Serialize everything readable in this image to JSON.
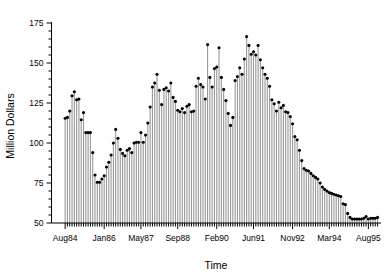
{
  "chart_data": {
    "type": "bar",
    "title": "",
    "xlabel": "Time",
    "ylabel": "Million Dollars",
    "ylim": [
      50,
      178
    ],
    "yticks": [
      50,
      75,
      100,
      125,
      150,
      175
    ],
    "ytick_labels": [
      "50",
      "75",
      "100",
      "125",
      "150",
      "175"
    ],
    "grid": false,
    "legend": null,
    "style": "needle-plot-with-point-markers",
    "baseline": 50,
    "marker_color": "#000000",
    "stem_color": "#999999",
    "axis_color": "#000000",
    "xtick_labels": [
      "Aug84",
      "Jan86",
      "May87",
      "Sep88",
      "Feb90",
      "Jun91",
      "Nov92",
      "Mar94",
      "Aug95"
    ],
    "xtick_indices": [
      0,
      17,
      33,
      49,
      66,
      82,
      99,
      115,
      132
    ],
    "n_points": 137,
    "categories": [
      "Aug84",
      "Sep84",
      "Oct84",
      "Nov84",
      "Dec84",
      "Jan85",
      "Feb85",
      "Mar85",
      "Apr85",
      "May85",
      "Jun85",
      "Jul85",
      "Aug85",
      "Sep85",
      "Oct85",
      "Nov85",
      "Dec85",
      "Jan86",
      "Feb86",
      "Mar86",
      "Apr86",
      "May86",
      "Jun86",
      "Jul86",
      "Aug86",
      "Sep86",
      "Oct86",
      "Nov86",
      "Dec86",
      "Jan87",
      "Feb87",
      "Mar87",
      "Apr87",
      "May87",
      "Jun87",
      "Jul87",
      "Aug87",
      "Sep87",
      "Oct87",
      "Nov87",
      "Dec87",
      "Jan88",
      "Feb88",
      "Mar88",
      "Apr88",
      "May88",
      "Jun88",
      "Jul88",
      "Aug88",
      "Sep88",
      "Oct88",
      "Nov88",
      "Dec88",
      "Jan89",
      "Feb89",
      "Mar89",
      "Apr89",
      "May89",
      "Jun89",
      "Jul89",
      "Aug89",
      "Sep89",
      "Oct89",
      "Nov89",
      "Dec89",
      "Jan90",
      "Feb90",
      "Mar90",
      "Apr90",
      "May90",
      "Jun90",
      "Jul90",
      "Aug90",
      "Sep90",
      "Oct90",
      "Nov90",
      "Dec90",
      "Jan91",
      "Feb91",
      "Mar91",
      "Apr91",
      "May91",
      "Jun91",
      "Jul91",
      "Aug91",
      "Sep91",
      "Oct91",
      "Nov91",
      "Dec91",
      "Jan92",
      "Feb92",
      "Mar92",
      "Apr92",
      "May92",
      "Jun92",
      "Jul92",
      "Aug92",
      "Sep92",
      "Oct92",
      "Nov92",
      "Dec92",
      "Jan93",
      "Feb93",
      "Mar93",
      "Apr93",
      "May93",
      "Jun93",
      "Jul93",
      "Aug93",
      "Sep93",
      "Oct93",
      "Nov93",
      "Dec93",
      "Jan94",
      "Feb94",
      "Mar94",
      "Apr94",
      "May94",
      "Jun94",
      "Jul94",
      "Aug94",
      "Sep94",
      "Oct94",
      "Nov94",
      "Dec94",
      "Jan95",
      "Feb95",
      "Mar95",
      "Apr95",
      "May95",
      "Jun95",
      "Jul95",
      "Aug95",
      "Sep95",
      "Oct95",
      "Nov95",
      "Dec95"
    ],
    "values": [
      115.5,
      116.0,
      120.0,
      129.5,
      132.0,
      127.0,
      127.5,
      114.5,
      119.0,
      106.5,
      106.5,
      106.5,
      94.0,
      80.0,
      75.5,
      75.5,
      77.5,
      79.5,
      85.0,
      88.0,
      92.5,
      100.0,
      108.5,
      103.0,
      96.0,
      93.5,
      92.0,
      95.5,
      96.5,
      94.0,
      100.0,
      100.5,
      100.5,
      106.5,
      100.5,
      105.0,
      112.5,
      122.5,
      135.0,
      137.5,
      143.0,
      133.0,
      124.0,
      133.5,
      134.5,
      132.5,
      137.5,
      128.5,
      126.0,
      120.5,
      119.5,
      121.5,
      119.0,
      123.0,
      124.0,
      119.5,
      120.0,
      135.5,
      140.5,
      136.5,
      135.0,
      127.5,
      161.5,
      141.0,
      135.0,
      146.5,
      147.5,
      159.5,
      141.0,
      133.5,
      126.5,
      118.5,
      111.0,
      116.0,
      139.0,
      141.5,
      147.0,
      143.0,
      152.5,
      166.5,
      161.0,
      155.5,
      157.0,
      155.0,
      161.0,
      152.0,
      147.0,
      143.0,
      140.5,
      135.5,
      127.0,
      124.5,
      120.0,
      125.5,
      122.0,
      123.5,
      119.5,
      119.0,
      116.5,
      112.0,
      104.0,
      102.0,
      95.5,
      89.0,
      84.0,
      83.0,
      82.5,
      81.0,
      79.5,
      78.5,
      77.5,
      75.0,
      72.5,
      71.0,
      70.0,
      69.0,
      68.5,
      68.0,
      67.5,
      67.0,
      66.5,
      62.0,
      61.5,
      56.0,
      53.5,
      52.5,
      52.5,
      52.5,
      52.5,
      52.5,
      53.0,
      54.0,
      52.5,
      53.0,
      53.0,
      53.0,
      53.5
    ]
  }
}
